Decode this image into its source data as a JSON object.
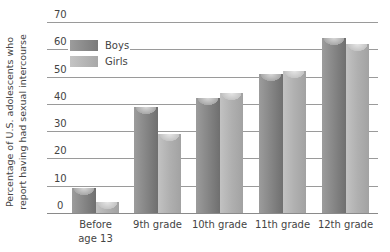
{
  "chart_data": {
    "type": "bar",
    "title": "",
    "xlabel": "",
    "ylabel": "Percentage of U.S. adolescents who report having had sexual intercourse",
    "ylabel_lines": [
      "Percentage of U.S. adolescents who",
      "report having had sexual intercourse"
    ],
    "categories": [
      "Before age 13",
      "9th grade",
      "10th grade",
      "11th grade",
      "12th grade"
    ],
    "category_lines": [
      [
        "Before",
        "age 13"
      ],
      [
        "9th grade"
      ],
      [
        "10th grade"
      ],
      [
        "11th grade"
      ],
      [
        "12th grade"
      ]
    ],
    "series": [
      {
        "name": "Boys",
        "values": [
          9,
          39,
          42,
          51,
          64
        ],
        "color": "#8a8a8a"
      },
      {
        "name": "Girls",
        "values": [
          4,
          29,
          44,
          52,
          62
        ],
        "color": "#b4b4b4"
      }
    ],
    "yticks": [
      0,
      10,
      20,
      30,
      40,
      50,
      60,
      70
    ],
    "ylim": [
      0,
      70
    ],
    "grid": true,
    "legend_position": "top-left"
  },
  "legend": {
    "items": [
      {
        "label": "Boys",
        "color": "#8a8a8a"
      },
      {
        "label": "Girls",
        "color": "#b4b4b4"
      }
    ]
  }
}
